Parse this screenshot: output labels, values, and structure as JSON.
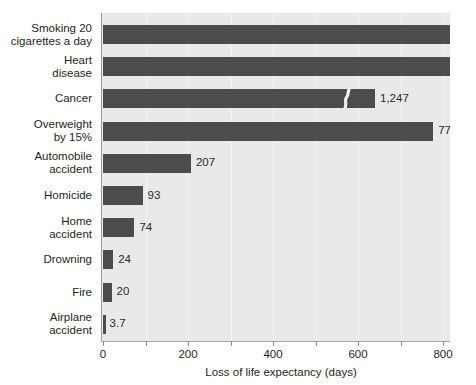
{
  "chart_data": {
    "type": "bar",
    "orientation": "horizontal",
    "title": "",
    "xlabel": "Loss of life expectancy (days)",
    "ylabel": "",
    "xlim": [
      0,
      820
    ],
    "grid": true,
    "legend": "none",
    "axis_break": {
      "present": true,
      "note": "S-shaped break symbol on bars exceeding the axis range",
      "broken_categories": [
        "Smoking 20 cigarettes a day",
        "Heart disease",
        "Cancer"
      ]
    },
    "xticks": [
      0,
      100,
      200,
      300,
      400,
      500,
      600,
      700,
      800
    ],
    "xtick_labels": [
      "0",
      "",
      "200",
      "",
      "400",
      "",
      "600",
      "",
      "800"
    ],
    "categories": [
      "Smoking 20\ncigarettes a day",
      "Heart\ndisease",
      "Cancer",
      "Overweight\nby 15%",
      "Automobile\naccident",
      "Homicide",
      "Home\naccident",
      "Drowning",
      "Fire",
      "Airplane\naccident"
    ],
    "values": [
      2370,
      1607,
      1247,
      777,
      207,
      93,
      74,
      24,
      20,
      3.7
    ],
    "value_labels": [
      "2,370",
      "1,607",
      "1,247",
      "777",
      "207",
      "93",
      "74",
      "24",
      "20",
      "3.7"
    ],
    "colors": {
      "bar": "#4c4c4c",
      "plot_background": "#e9e9e9",
      "gridline": "#f4f4f4",
      "axis": "#9a9a9a",
      "text": "#231f20"
    }
  }
}
